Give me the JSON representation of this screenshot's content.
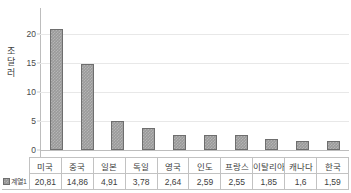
{
  "chart_data": {
    "type": "bar",
    "title": "",
    "xlabel": "",
    "ylabel": "조 달러",
    "ylabel_chars": [
      "조",
      "달",
      "러"
    ],
    "categories": [
      "미국",
      "중국",
      "일본",
      "독일",
      "영국",
      "인도",
      "프랑스",
      "이탈리아",
      "캐나다",
      "한국"
    ],
    "values": [
      20.81,
      14.86,
      4.91,
      3.78,
      2.64,
      2.59,
      2.55,
      1.85,
      1.6,
      1.59
    ],
    "value_labels": [
      "20,81",
      "14,86",
      "4,91",
      "3,78",
      "2,64",
      "2,59",
      "2,55",
      "1,85",
      "1,6",
      "1,59"
    ],
    "series": [
      {
        "name": "계열1",
        "values": [
          20.81,
          14.86,
          4.91,
          3.78,
          2.64,
          2.59,
          2.55,
          1.85,
          1.6,
          1.59
        ]
      }
    ],
    "ylim": [
      0,
      22
    ],
    "yticks": [
      0,
      5,
      10,
      15,
      20
    ],
    "ytick_labels": [
      "0",
      "5",
      "10",
      "15",
      "20"
    ],
    "grid": true,
    "legend_position": "data-table-left",
    "show_data_table": true,
    "bar_color": "#9a9a9a",
    "bar_border_color": "#6e6e6e",
    "gridline_color": "#e8e8e8",
    "axis_color": "#bdbdbd"
  },
  "legend": {
    "series_label": "계열1"
  }
}
